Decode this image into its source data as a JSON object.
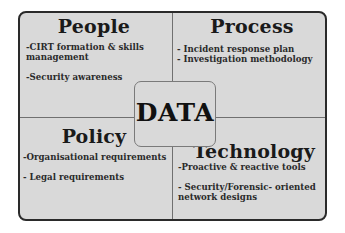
{
  "diagram": {
    "center": {
      "label": "DATA"
    },
    "quadrants": [
      {
        "id": "people",
        "title": "People",
        "items": [
          "-CIRT formation & skills\nmanagement",
          "-Security awareness"
        ]
      },
      {
        "id": "process",
        "title": "Process",
        "items": [
          "- Incident response plan",
          "- Investigation methodology"
        ]
      },
      {
        "id": "policy",
        "title": "Policy",
        "items": [
          "-Organisational requirements",
          "- Legal requirements"
        ]
      },
      {
        "id": "technology",
        "title": "Technology",
        "items": [
          "-Proactive & reactive tools",
          "- Security/Forensic- oriented\nnetwork designs"
        ]
      }
    ],
    "colors": {
      "fill": "#d9d9d9",
      "border": "#2a2a2a",
      "divider": "#707070",
      "text": "#1a1a1a"
    }
  }
}
